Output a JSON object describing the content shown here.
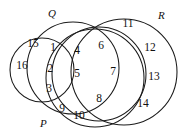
{
  "diagram": {
    "type": "venn-diagram",
    "title": "",
    "stroke_color": "#1a1a1a",
    "background_color": "#ffffff",
    "set_labels": [
      {
        "name": "Q",
        "text": "Q",
        "x": 48,
        "y": 8
      },
      {
        "name": "R",
        "text": "R",
        "x": 158,
        "y": 10
      },
      {
        "name": "P",
        "text": "P",
        "x": 40,
        "y": 118
      }
    ],
    "circles": [
      {
        "name": "leftmost-circle",
        "cx": 42,
        "cy": 70,
        "r": 32
      },
      {
        "name": "q-circle",
        "cx": 73,
        "cy": 68,
        "r": 46
      },
      {
        "name": "middle-circle",
        "cx": 99,
        "cy": 74,
        "r": 47
      },
      {
        "name": "r-circle",
        "cx": 124,
        "cy": 72,
        "r": 53
      },
      {
        "name": "p-circle",
        "cx": 95,
        "cy": 78,
        "r": 49
      }
    ],
    "elements": [
      {
        "value": "15",
        "x": 33,
        "y": 44
      },
      {
        "value": "16",
        "x": 22,
        "y": 66
      },
      {
        "value": "1",
        "x": 53,
        "y": 48
      },
      {
        "value": "2",
        "x": 50,
        "y": 69
      },
      {
        "value": "3",
        "x": 49,
        "y": 89
      },
      {
        "value": "4",
        "x": 77,
        "y": 51
      },
      {
        "value": "5",
        "x": 77,
        "y": 74
      },
      {
        "value": "6",
        "x": 101,
        "y": 46
      },
      {
        "value": "7",
        "x": 113,
        "y": 72
      },
      {
        "value": "8",
        "x": 99,
        "y": 99
      },
      {
        "value": "9",
        "x": 62,
        "y": 109
      },
      {
        "value": "10",
        "x": 79,
        "y": 116
      },
      {
        "value": "11",
        "x": 128,
        "y": 24
      },
      {
        "value": "12",
        "x": 150,
        "y": 48
      },
      {
        "value": "13",
        "x": 154,
        "y": 77
      },
      {
        "value": "14",
        "x": 143,
        "y": 104
      }
    ]
  }
}
